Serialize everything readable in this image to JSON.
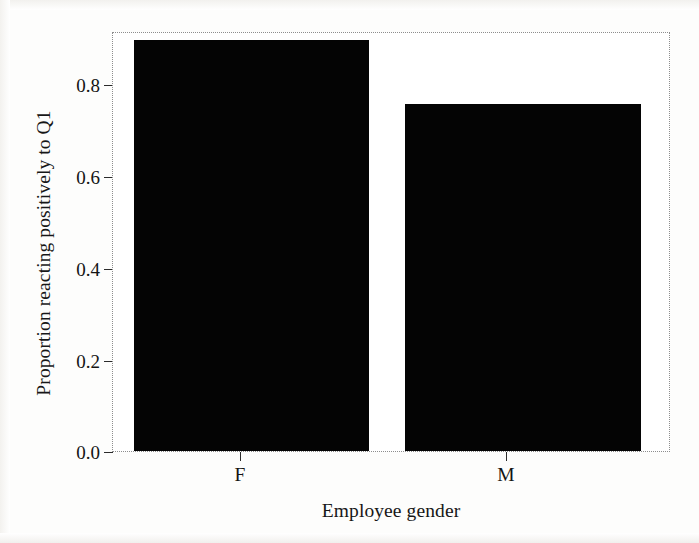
{
  "chart_data": {
    "type": "bar",
    "title": "",
    "subtitle": "",
    "xlabel": "Employee gender",
    "ylabel": "Proportion reacting positively to Q1",
    "categories": [
      "F",
      "M"
    ],
    "values": [
      0.9,
      0.76
    ],
    "series": [
      {
        "name": "Proportion reacting positively to Q1",
        "values": [
          0.9,
          0.76
        ]
      }
    ],
    "ylim": [
      0.0,
      0.915
    ],
    "xlim": [
      0,
      2
    ],
    "yticks": [
      0.0,
      0.2,
      0.4,
      0.6,
      0.8
    ],
    "ytick_labels": [
      "0.0",
      "0.2",
      "0.4",
      "0.6",
      "0.8"
    ],
    "xtick_labels": [
      "F",
      "M"
    ],
    "grid": false,
    "legend": "none",
    "bar_color": "#040404",
    "frame_color": "#8d8d8d",
    "background": "#ffffff"
  },
  "axes": {
    "y_title": "Proportion reacting positively to Q1",
    "x_title": "Employee gender"
  }
}
